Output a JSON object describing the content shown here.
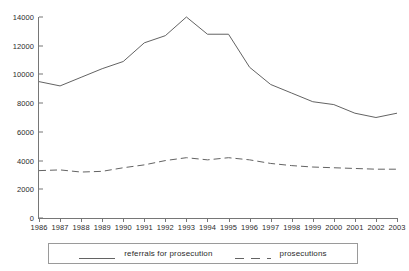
{
  "chart_data": {
    "type": "line",
    "title": "",
    "subtitle": "",
    "xlabel": "",
    "ylabel": "",
    "grid": false,
    "legend_position": "bottom",
    "x": [
      1986,
      1987,
      1988,
      1989,
      1990,
      1991,
      1992,
      1993,
      1994,
      1995,
      1996,
      1997,
      1998,
      1999,
      2000,
      2001,
      2002,
      2003
    ],
    "categories": [
      "1986",
      "1987",
      "1988",
      "1989",
      "1990",
      "1991",
      "1992",
      "1993",
      "1994",
      "1995",
      "1996",
      "1997",
      "1998",
      "1999",
      "2000",
      "2001",
      "2002",
      "2003"
    ],
    "ylim": [
      0,
      14000
    ],
    "ytick_values": [
      0,
      2000,
      4000,
      6000,
      8000,
      10000,
      12000,
      14000
    ],
    "ytick_labels": [
      "0",
      "2000",
      "4000",
      "6000",
      "8000",
      "10000",
      "12000",
      "14000"
    ],
    "series": [
      {
        "name": "referrals for prosecution",
        "style": "solid",
        "color": "#636363",
        "values": [
          9500,
          9200,
          9800,
          10400,
          10900,
          12200,
          12700,
          14000,
          12800,
          12800,
          10500,
          9300,
          8700,
          8100,
          7900,
          7300,
          7000,
          7300
        ]
      },
      {
        "name": "prosecutions",
        "style": "dashed",
        "color": "#636363",
        "values": [
          3300,
          3350,
          3200,
          3250,
          3500,
          3700,
          4000,
          4200,
          4050,
          4200,
          4050,
          3800,
          3650,
          3550,
          3500,
          3450,
          3400,
          3400
        ]
      }
    ]
  },
  "legend": {
    "entries": [
      {
        "label": "referrals for prosecution",
        "style": "solid"
      },
      {
        "label": "prosecutions",
        "style": "dashed"
      }
    ]
  },
  "colors": {
    "axis": "#767676",
    "line": "#636363",
    "text": "#2b2b2b",
    "background": "#ffffff"
  }
}
